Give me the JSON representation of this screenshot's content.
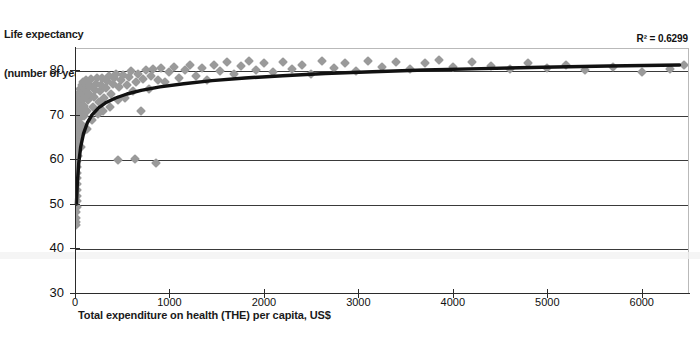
{
  "chart_data": {
    "type": "scatter",
    "title": "",
    "ylabel": "Life expectancy\n(number of years)",
    "ylabel_line1": "Life expectancy",
    "ylabel_line2": "(number of years)",
    "xlabel": "Total expenditure on health (THE) per capita, US$",
    "annotation": "R² = 0.6299",
    "r_squared": 0.6299,
    "grid": "horizontal",
    "legend": "none",
    "xlim": [
      0,
      6500
    ],
    "ylim": [
      30,
      85
    ],
    "xticks": [
      0,
      1000,
      2000,
      3000,
      4000,
      5000,
      6000
    ],
    "xtick_labels": [
      "0",
      "1000",
      "2000",
      "3000",
      "4000",
      "5000",
      "6000"
    ],
    "yticks": [
      30,
      40,
      50,
      60,
      70,
      80
    ],
    "ytick_labels": [
      "30",
      "40",
      "50",
      "60",
      "70",
      "80"
    ],
    "marker": "diamond",
    "marker_color": "#9a9a9a",
    "trendline": {
      "type": "logarithmic",
      "color": "#111111",
      "width": 3.4,
      "points": [
        [
          15,
          50.2
        ],
        [
          25,
          55.0
        ],
        [
          40,
          59.5
        ],
        [
          60,
          63.0
        ],
        [
          90,
          66.0
        ],
        [
          130,
          68.4
        ],
        [
          180,
          70.2
        ],
        [
          250,
          71.8
        ],
        [
          330,
          73.0
        ],
        [
          430,
          74.0
        ],
        [
          550,
          74.9
        ],
        [
          700,
          75.7
        ],
        [
          900,
          76.5
        ],
        [
          1150,
          77.2
        ],
        [
          1450,
          77.9
        ],
        [
          1800,
          78.5
        ],
        [
          2200,
          79.0
        ],
        [
          2650,
          79.5
        ],
        [
          3150,
          79.9
        ],
        [
          3700,
          80.3
        ],
        [
          4300,
          80.6
        ],
        [
          4950,
          80.9
        ],
        [
          5650,
          81.2
        ],
        [
          6400,
          81.4
        ]
      ]
    },
    "points": [
      [
        10,
        45.5
      ],
      [
        12,
        46.2
      ],
      [
        14,
        47.0
      ],
      [
        15,
        48.3
      ],
      [
        16,
        49.5
      ],
      [
        18,
        50.8
      ],
      [
        20,
        52.0
      ],
      [
        20,
        53.4
      ],
      [
        22,
        54.6
      ],
      [
        23,
        56.0
      ],
      [
        24,
        57.2
      ],
      [
        25,
        58.5
      ],
      [
        26,
        59.8
      ],
      [
        27,
        61.0
      ],
      [
        28,
        62.3
      ],
      [
        29,
        63.5
      ],
      [
        30,
        64.8
      ],
      [
        31,
        65.9
      ],
      [
        32,
        67.0
      ],
      [
        33,
        68.2
      ],
      [
        34,
        69.3
      ],
      [
        35,
        70.4
      ],
      [
        36,
        71.2
      ],
      [
        37,
        72.0
      ],
      [
        38,
        72.9
      ],
      [
        40,
        73.6
      ],
      [
        42,
        74.4
      ],
      [
        44,
        75.1
      ],
      [
        46,
        66.0
      ],
      [
        48,
        69.5
      ],
      [
        50,
        71.0
      ],
      [
        52,
        73.0
      ],
      [
        55,
        74.8
      ],
      [
        58,
        76.0
      ],
      [
        60,
        63.0
      ],
      [
        62,
        70.2
      ],
      [
        65,
        72.5
      ],
      [
        68,
        74.0
      ],
      [
        70,
        75.5
      ],
      [
        72,
        77.0
      ],
      [
        75,
        68.0
      ],
      [
        78,
        71.5
      ],
      [
        80,
        73.8
      ],
      [
        82,
        75.2
      ],
      [
        85,
        76.4
      ],
      [
        88,
        77.6
      ],
      [
        90,
        66.5
      ],
      [
        95,
        70.0
      ],
      [
        100,
        72.2
      ],
      [
        105,
        74.5
      ],
      [
        110,
        76.0
      ],
      [
        115,
        77.2
      ],
      [
        120,
        78.0
      ],
      [
        125,
        67.0
      ],
      [
        130,
        71.0
      ],
      [
        140,
        73.5
      ],
      [
        150,
        75.0
      ],
      [
        160,
        76.8
      ],
      [
        170,
        78.2
      ],
      [
        180,
        69.0
      ],
      [
        190,
        72.0
      ],
      [
        200,
        74.2
      ],
      [
        210,
        75.9
      ],
      [
        220,
        77.1
      ],
      [
        230,
        78.4
      ],
      [
        240,
        70.5
      ],
      [
        250,
        73.0
      ],
      [
        260,
        75.5
      ],
      [
        275,
        77.0
      ],
      [
        290,
        78.6
      ],
      [
        300,
        71.0
      ],
      [
        310,
        74.0
      ],
      [
        325,
        76.2
      ],
      [
        340,
        77.8
      ],
      [
        355,
        79.0
      ],
      [
        370,
        72.0
      ],
      [
        385,
        75.0
      ],
      [
        400,
        77.2
      ],
      [
        415,
        78.5
      ],
      [
        430,
        79.4
      ],
      [
        450,
        60.0
      ],
      [
        455,
        73.5
      ],
      [
        470,
        76.5
      ],
      [
        490,
        78.0
      ],
      [
        510,
        79.2
      ],
      [
        530,
        74.0
      ],
      [
        550,
        77.0
      ],
      [
        570,
        78.8
      ],
      [
        590,
        80.0
      ],
      [
        610,
        75.5
      ],
      [
        630,
        60.3
      ],
      [
        650,
        77.5
      ],
      [
        670,
        79.5
      ],
      [
        700,
        71.0
      ],
      [
        720,
        78.2
      ],
      [
        750,
        80.2
      ],
      [
        780,
        76.0
      ],
      [
        800,
        79.0
      ],
      [
        830,
        80.5
      ],
      [
        860,
        59.5
      ],
      [
        880,
        78.0
      ],
      [
        910,
        80.8
      ],
      [
        950,
        77.5
      ],
      [
        1000,
        79.8
      ],
      [
        1050,
        81.0
      ],
      [
        1100,
        78.5
      ],
      [
        1160,
        80.3
      ],
      [
        1220,
        81.3
      ],
      [
        1280,
        79.0
      ],
      [
        1340,
        80.8
      ],
      [
        1400,
        78.0
      ],
      [
        1470,
        81.5
      ],
      [
        1540,
        80.0
      ],
      [
        1610,
        82.0
      ],
      [
        1680,
        79.3
      ],
      [
        1760,
        81.2
      ],
      [
        1840,
        82.3
      ],
      [
        1920,
        80.2
      ],
      [
        2000,
        81.8
      ],
      [
        2100,
        79.8
      ],
      [
        2200,
        82.0
      ],
      [
        2300,
        80.6
      ],
      [
        2400,
        81.5
      ],
      [
        2500,
        79.5
      ],
      [
        2620,
        82.2
      ],
      [
        2740,
        80.8
      ],
      [
        2860,
        81.9
      ],
      [
        2980,
        80.0
      ],
      [
        3100,
        82.4
      ],
      [
        3250,
        81.0
      ],
      [
        3400,
        82.0
      ],
      [
        3550,
        80.5
      ],
      [
        3700,
        81.8
      ],
      [
        3850,
        82.6
      ],
      [
        4000,
        80.9
      ],
      [
        4200,
        82.1
      ],
      [
        4400,
        81.2
      ],
      [
        4600,
        80.4
      ],
      [
        4800,
        81.9
      ],
      [
        5000,
        80.8
      ],
      [
        5200,
        81.5
      ],
      [
        5400,
        80.2
      ],
      [
        5700,
        81.0
      ],
      [
        6000,
        79.8
      ],
      [
        6300,
        80.6
      ],
      [
        6450,
        81.3
      ]
    ]
  }
}
